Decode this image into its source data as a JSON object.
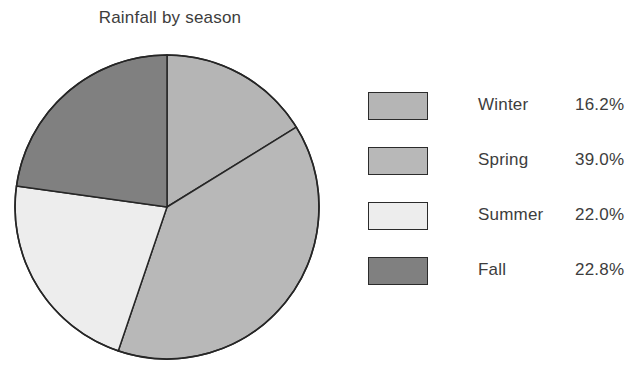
{
  "chart_data": {
    "type": "pie",
    "title": "Rainfall by season",
    "categories": [
      "Winter",
      "Spring",
      "Summer",
      "Fall"
    ],
    "values": [
      16.2,
      39.0,
      22.0,
      22.8
    ],
    "value_labels": [
      "16.2%",
      "39.0%",
      "22.0%",
      "22.8%"
    ],
    "unit": "%",
    "start_angle_deg": 0,
    "direction": "clockwise",
    "legend_position": "right",
    "grid": false,
    "slice_colors": [
      "#b5b5b5",
      "#b8b8b8",
      "#ededed",
      "#808080"
    ],
    "outline_color": "#262626",
    "background": "#ffffff",
    "geometry": {
      "center_x": 167,
      "center_y": 169,
      "radius": 152
    }
  },
  "legend": {
    "rows": [
      {
        "label": "Winter",
        "value": "16.2%",
        "color": "#b5b5b5"
      },
      {
        "label": "Spring",
        "value": "39.0%",
        "color": "#b8b8b8"
      },
      {
        "label": "Summer",
        "value": "22.0%",
        "color": "#ededed"
      },
      {
        "label": "Fall",
        "value": "22.8%",
        "color": "#808080"
      }
    ]
  }
}
